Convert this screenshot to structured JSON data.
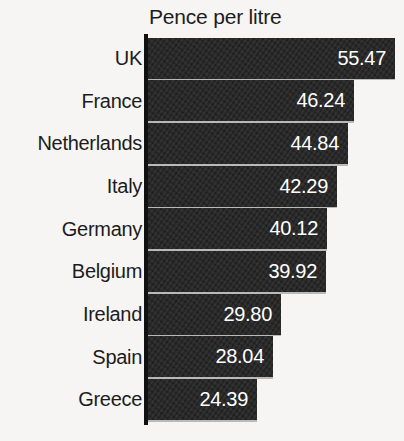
{
  "chart": {
    "title": "Pence per litre"
  },
  "chart_data": {
    "type": "bar",
    "orientation": "horizontal",
    "title": "Pence per litre",
    "xlabel": "",
    "ylabel": "",
    "categories": [
      "UK",
      "France",
      "Netherlands",
      "Italy",
      "Germany",
      "Belgium",
      "Ireland",
      "Spain",
      "Greece"
    ],
    "values": [
      55.47,
      46.24,
      44.84,
      42.29,
      40.12,
      39.92,
      29.8,
      28.04,
      24.39
    ],
    "value_labels": [
      "55.47",
      "46.24",
      "44.84",
      "42.29",
      "40.12",
      "39.92",
      "29.80",
      "28.04",
      "24.39"
    ],
    "xlim": [
      0,
      57.5
    ],
    "grid": false,
    "legend": null,
    "bar_color": "#232323",
    "value_label_color": "#ffffff",
    "background_color": "#f6f5f3",
    "axis_color": "#111111"
  }
}
